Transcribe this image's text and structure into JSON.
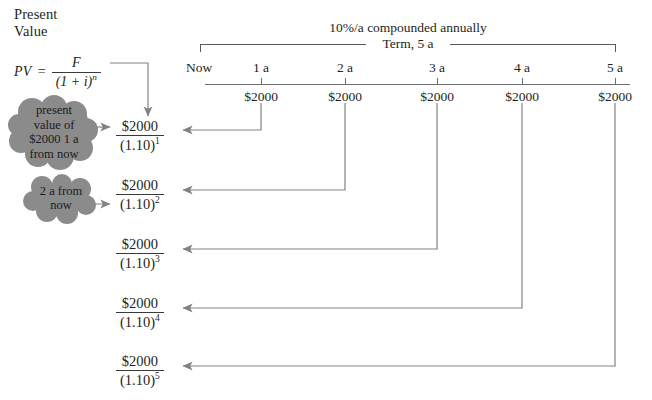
{
  "diagram": {
    "heading": "Present\nValue",
    "formula": {
      "lhs": "PV",
      "equals": "=",
      "numerator": "F",
      "denominator_base": "(1 + i)",
      "denominator_exponent": "n"
    },
    "timeline": {
      "rate_label": "10%/a compounded annually",
      "term_label": "Term, 5 a",
      "now_label": "Now",
      "year_labels": [
        "1 a",
        "2 a",
        "3 a",
        "4 a",
        "5 a"
      ],
      "cash_flows": [
        "$2000",
        "$2000",
        "$2000",
        "$2000",
        "$2000"
      ]
    },
    "pv_terms": [
      {
        "numerator": "$2000",
        "denominator_base": "(1.10)",
        "exponent": "1"
      },
      {
        "numerator": "$2000",
        "denominator_base": "(1.10)",
        "exponent": "2"
      },
      {
        "numerator": "$2000",
        "denominator_base": "(1.10)",
        "exponent": "3"
      },
      {
        "numerator": "$2000",
        "denominator_base": "(1.10)",
        "exponent": "4"
      },
      {
        "numerator": "$2000",
        "denominator_base": "(1.10)",
        "exponent": "5"
      }
    ],
    "callouts": [
      {
        "text": "present\nvalue of\n$2000 1 a\nfrom now"
      },
      {
        "text": "2 a from\nnow"
      }
    ],
    "colors": {
      "background": "#ffffff",
      "text": "#231f20",
      "line": "#808285",
      "axis": "#6d6e71",
      "cloud_fill": "#8b8b8b"
    }
  }
}
